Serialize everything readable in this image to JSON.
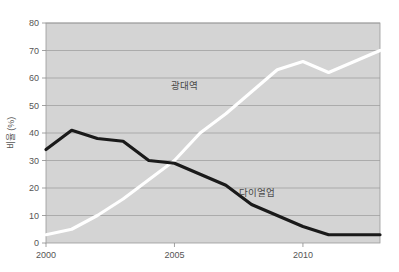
{
  "chart_data": {
    "type": "line",
    "title": "",
    "xlabel": "",
    "ylabel": "비율 (%)",
    "xlim": [
      2000,
      2013
    ],
    "ylim": [
      0,
      80
    ],
    "grid": true,
    "legend": "inline-annotations",
    "plot_background": "#d4d4d4",
    "page_background": "#ffffff",
    "x": [
      2000,
      2001,
      2002,
      2003,
      2004,
      2005,
      2006,
      2007,
      2008,
      2009,
      2010,
      2011,
      2012,
      2013
    ],
    "xticks": [
      2000,
      2005,
      2010
    ],
    "xtick_labels": [
      "2000",
      "2005",
      "2010"
    ],
    "yticks": [
      0,
      10,
      20,
      30,
      40,
      50,
      60,
      70,
      80
    ],
    "ytick_labels": [
      "0",
      "10",
      "20",
      "30",
      "40",
      "50",
      "60",
      "70",
      "80"
    ],
    "series": [
      {
        "name": "광대역",
        "color": "#ffffff",
        "label_x": 2005.4,
        "label_y": 56,
        "values": [
          3,
          5,
          10,
          16,
          23,
          30,
          40,
          47,
          55,
          63,
          66,
          62,
          66,
          70
        ]
      },
      {
        "name": "다이얼업",
        "color": "#1a1a1a",
        "label_x": 2008.2,
        "label_y": 17,
        "values": [
          34,
          41,
          38,
          37,
          30,
          29,
          25,
          21,
          14,
          10,
          6,
          3,
          3,
          3
        ]
      }
    ]
  },
  "axis": {
    "y_title": "비율 (%)"
  }
}
